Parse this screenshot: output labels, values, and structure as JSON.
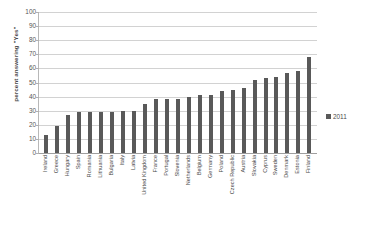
{
  "chart_data": {
    "type": "bar",
    "title": "",
    "xlabel": "",
    "ylabel": "percent answering \"Yes\"",
    "ylim": [
      0,
      100
    ],
    "yticks": [
      100,
      90,
      80,
      70,
      60,
      50,
      40,
      30,
      20,
      10,
      0
    ],
    "grid": true,
    "legend_position": "right",
    "series": [
      {
        "name": "2011",
        "color": "#595959",
        "values": [
          13,
          19,
          27,
          29,
          29,
          29,
          29,
          30,
          30,
          35,
          38,
          38,
          38,
          40,
          41,
          41,
          44,
          45,
          46,
          52,
          53,
          54,
          57,
          58,
          68
        ]
      }
    ],
    "categories": [
      "Ireland",
      "Greece",
      "Hungary",
      "Spain",
      "Romania",
      "Lithuania",
      "Bulgaria",
      "Italy",
      "Latvia",
      "United Kingdom",
      "France",
      "Portugal",
      "Slovenia",
      "Netherlands",
      "Belgium",
      "Germany",
      "Poland",
      "Czech Republic",
      "Austria",
      "Slovakia",
      "Cyprus",
      "Sweden",
      "Denmark",
      "Estonia",
      "Finland"
    ]
  },
  "legend": {
    "entries": [
      {
        "label": "2011",
        "color": "#595959"
      }
    ]
  }
}
